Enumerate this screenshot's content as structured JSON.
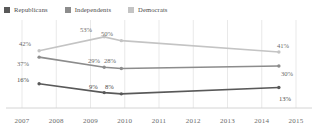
{
  "top_sliver_text": "....",
  "legend": {
    "items": [
      {
        "label": "Republicans",
        "color": "#595959",
        "key": "republicans"
      },
      {
        "label": "Independents",
        "color": "#8c8c8c",
        "key": "independents"
      },
      {
        "label": "Democrats",
        "color": "#c4c4c4",
        "key": "democrats"
      }
    ]
  },
  "axis": {
    "years": [
      "2007",
      "2008",
      "2009",
      "2010",
      "2011",
      "2012",
      "2013",
      "2014",
      "2015"
    ]
  },
  "chart_data": {
    "type": "line",
    "title": "",
    "subtitle": "",
    "xlabel": "",
    "ylabel": "",
    "xlim": [
      2007,
      2015
    ],
    "ylim": [
      0,
      60
    ],
    "grid": "vertical",
    "legend_position": "top-left",
    "x": [
      2007.5,
      2009.4,
      2009.9,
      2014.5
    ],
    "tick_labels": [
      "2007",
      "2008",
      "2009",
      "2010",
      "2011",
      "2012",
      "2013",
      "2014",
      "2015"
    ],
    "series": [
      {
        "name": "Democrats",
        "color": "#c4c4c4",
        "values": [
          42,
          53,
          50,
          41
        ],
        "labels": [
          "42%",
          "53%",
          "50%",
          "41%"
        ]
      },
      {
        "name": "Independents",
        "color": "#8c8c8c",
        "values": [
          37,
          29,
          28,
          30
        ],
        "labels": [
          "37%",
          "29%",
          "28%",
          "30%"
        ]
      },
      {
        "name": "Republicans",
        "color": "#595959",
        "values": [
          16,
          9,
          8,
          13
        ],
        "labels": [
          "16%",
          "9%",
          "8%",
          "13%"
        ]
      }
    ],
    "annotations": [
      {
        "text": "42%",
        "x": 19,
        "y": 40,
        "color": "#6b6b6b"
      },
      {
        "text": "53%",
        "x": 80,
        "y": 26,
        "color": "#6b6b6b"
      },
      {
        "text": "50%",
        "x": 101,
        "y": 30,
        "color": "#6b6b6b"
      },
      {
        "text": "41%",
        "x": 277,
        "y": 42,
        "color": "#6b6b6b"
      },
      {
        "text": "37%",
        "x": 17,
        "y": 60,
        "color": "#6b6b6b"
      },
      {
        "text": "29%",
        "x": 88,
        "y": 57,
        "color": "#6b6b6b"
      },
      {
        "text": "28%",
        "x": 104,
        "y": 57,
        "color": "#6b6b6b"
      },
      {
        "text": "30%",
        "x": 281,
        "y": 70,
        "color": "#6b6b6b"
      },
      {
        "text": "16%",
        "x": 17,
        "y": 76,
        "color": "#4a4a4a"
      },
      {
        "text": "9%",
        "x": 89,
        "y": 83,
        "color": "#4a4a4a"
      },
      {
        "text": "8%",
        "x": 105,
        "y": 83,
        "color": "#4a4a4a"
      },
      {
        "text": "13%",
        "x": 279,
        "y": 95,
        "color": "#4a4a4a"
      }
    ]
  }
}
